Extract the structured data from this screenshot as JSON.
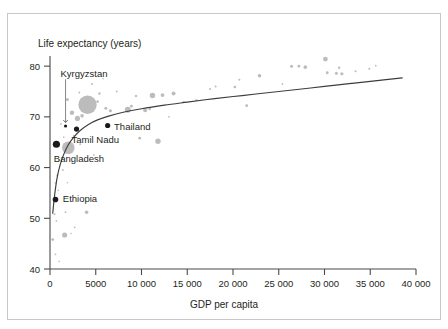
{
  "figure": {
    "background_color": "#ffffff",
    "frame_color": "#c9c9c9",
    "axis_color": "#4a4a4a",
    "trend_color": "#3d3d3d",
    "bubble_color": "#b3b3b3",
    "highlight_color": "#1a1a1a"
  },
  "chart_data": {
    "type": "scatter",
    "title": "",
    "subtitle": "",
    "xlabel": "GDP per capita",
    "ylabel": "Life expectancy (years)",
    "xlim": [
      0,
      40000
    ],
    "ylim": [
      40,
      82
    ],
    "grid": false,
    "legend": "none",
    "xticks": [
      0,
      5000,
      10000,
      15000,
      20000,
      25000,
      30000,
      35000,
      40000
    ],
    "xtick_labels": [
      "0",
      "5000",
      "10 000",
      "15 000",
      "20 000",
      "25 000",
      "30 000",
      "35 000",
      "40 000"
    ],
    "yticks": [
      40,
      50,
      60,
      70,
      80
    ],
    "ytick_labels": [
      "40",
      "50",
      "60",
      "70",
      "80"
    ],
    "annotations": [
      {
        "label": "Kyrgyzstan",
        "x": 1700,
        "y": 68.2,
        "text_x": 1150,
        "text_y": 78.6,
        "arrow": true
      },
      {
        "label": "Thailand",
        "x": 6300,
        "y": 68.3,
        "text_x": 7000,
        "text_y": 68.0,
        "arrow": false
      },
      {
        "label": "Tamil Nadu",
        "x": 2900,
        "y": 67.6,
        "text_x": 2350,
        "text_y": 65.6,
        "arrow": false
      },
      {
        "label": "Bangladesh",
        "x": 700,
        "y": 64.6,
        "text_x": 420,
        "text_y": 61.7,
        "arrow": false
      },
      {
        "label": "Ethiopia",
        "x": 600,
        "y": 53.7,
        "text_x": 1400,
        "text_y": 53.9,
        "arrow": false
      }
    ],
    "highlight_points": [
      {
        "name": "Kyrgyzstan",
        "x": 1700,
        "y": 68.2,
        "r": 1.6
      },
      {
        "name": "Tamil Nadu",
        "x": 2900,
        "y": 67.6,
        "r": 2.6
      },
      {
        "name": "Thailand",
        "x": 6300,
        "y": 68.3,
        "r": 2.6
      },
      {
        "name": "Bangladesh",
        "x": 700,
        "y": 64.6,
        "r": 3.6
      },
      {
        "name": "Ethiopia",
        "x": 600,
        "y": 53.7,
        "r": 2.8
      }
    ],
    "bubbles": [
      {
        "x": 4100,
        "y": 72.4,
        "r": 9.2
      },
      {
        "x": 2000,
        "y": 63.9,
        "r": 6.3
      },
      {
        "x": 3000,
        "y": 69.7,
        "r": 2.6
      },
      {
        "x": 2400,
        "y": 70.8,
        "r": 2.2
      },
      {
        "x": 3500,
        "y": 70.2,
        "r": 1.8
      },
      {
        "x": 1900,
        "y": 73.4,
        "r": 1.5
      },
      {
        "x": 5200,
        "y": 73.0,
        "r": 1.3
      },
      {
        "x": 5400,
        "y": 74.6,
        "r": 1.2
      },
      {
        "x": 6100,
        "y": 71.7,
        "r": 1.5
      },
      {
        "x": 6600,
        "y": 71.2,
        "r": 1.6
      },
      {
        "x": 8500,
        "y": 71.4,
        "r": 3.0
      },
      {
        "x": 8900,
        "y": 72.1,
        "r": 1.4
      },
      {
        "x": 9400,
        "y": 74.1,
        "r": 1.2
      },
      {
        "x": 10400,
        "y": 71.3,
        "r": 2.0
      },
      {
        "x": 10900,
        "y": 71.6,
        "r": 1.4
      },
      {
        "x": 11200,
        "y": 74.2,
        "r": 2.7
      },
      {
        "x": 12300,
        "y": 74.3,
        "r": 1.9
      },
      {
        "x": 11800,
        "y": 65.2,
        "r": 2.7
      },
      {
        "x": 13500,
        "y": 74.6,
        "r": 2.0
      },
      {
        "x": 14600,
        "y": 72.9,
        "r": 1.1
      },
      {
        "x": 16000,
        "y": 73.3,
        "r": 1.0
      },
      {
        "x": 17500,
        "y": 75.5,
        "r": 1.0
      },
      {
        "x": 18100,
        "y": 76.0,
        "r": 1.0
      },
      {
        "x": 20200,
        "y": 75.9,
        "r": 1.3
      },
      {
        "x": 20700,
        "y": 77.3,
        "r": 1.0
      },
      {
        "x": 21500,
        "y": 72.2,
        "r": 1.4
      },
      {
        "x": 22900,
        "y": 78.1,
        "r": 1.8
      },
      {
        "x": 25400,
        "y": 76.5,
        "r": 0.9
      },
      {
        "x": 26400,
        "y": 80.0,
        "r": 1.5
      },
      {
        "x": 27200,
        "y": 80.0,
        "r": 1.4
      },
      {
        "x": 27900,
        "y": 79.8,
        "r": 1.8
      },
      {
        "x": 30100,
        "y": 81.4,
        "r": 2.4
      },
      {
        "x": 30300,
        "y": 78.7,
        "r": 1.4
      },
      {
        "x": 31300,
        "y": 78.6,
        "r": 1.5
      },
      {
        "x": 31600,
        "y": 79.7,
        "r": 1.2
      },
      {
        "x": 31900,
        "y": 78.5,
        "r": 1.6
      },
      {
        "x": 33400,
        "y": 79.0,
        "r": 1.0
      },
      {
        "x": 34900,
        "y": 79.5,
        "r": 1.0
      },
      {
        "x": 35600,
        "y": 80.1,
        "r": 0.9
      },
      {
        "x": 4600,
        "y": 76.5,
        "r": 1.0
      },
      {
        "x": 5800,
        "y": 77.5,
        "r": 0.8
      },
      {
        "x": 7300,
        "y": 75.0,
        "r": 0.9
      },
      {
        "x": 3200,
        "y": 74.8,
        "r": 0.9
      },
      {
        "x": 2600,
        "y": 66.3,
        "r": 0.9
      },
      {
        "x": 1200,
        "y": 68.6,
        "r": 0.9
      },
      {
        "x": 1500,
        "y": 66.0,
        "r": 0.8
      },
      {
        "x": 1000,
        "y": 61.5,
        "r": 0.9
      },
      {
        "x": 1400,
        "y": 59.5,
        "r": 1.0
      },
      {
        "x": 800,
        "y": 58.5,
        "r": 0.9
      },
      {
        "x": 600,
        "y": 57.0,
        "r": 0.9
      },
      {
        "x": 900,
        "y": 55.5,
        "r": 0.8
      },
      {
        "x": 1700,
        "y": 51.2,
        "r": 0.9
      },
      {
        "x": 500,
        "y": 50.8,
        "r": 1.0
      },
      {
        "x": 700,
        "y": 49.5,
        "r": 0.9
      },
      {
        "x": 1600,
        "y": 46.7,
        "r": 2.6
      },
      {
        "x": 300,
        "y": 45.8,
        "r": 1.4
      },
      {
        "x": 2300,
        "y": 47.0,
        "r": 0.8
      },
      {
        "x": 600,
        "y": 42.9,
        "r": 0.9
      },
      {
        "x": 1000,
        "y": 41.5,
        "r": 0.8
      },
      {
        "x": 4000,
        "y": 51.2,
        "r": 1.8
      },
      {
        "x": 3300,
        "y": 64.6,
        "r": 0.9
      },
      {
        "x": 9800,
        "y": 65.8,
        "r": 1.4
      },
      {
        "x": 13000,
        "y": 70.0,
        "r": 0.9
      },
      {
        "x": 4800,
        "y": 62.5,
        "r": 0.9
      },
      {
        "x": 1900,
        "y": 57.0,
        "r": 0.8
      },
      {
        "x": 2700,
        "y": 48.2,
        "r": 0.8
      }
    ],
    "trend_line": {
      "description": "Fitted logarithmic curve of life expectancy against GDP per capita",
      "points": [
        [
          300,
          51.0
        ],
        [
          500,
          54.5
        ],
        [
          800,
          58.2
        ],
        [
          1100,
          60.5
        ],
        [
          1500,
          62.6
        ],
        [
          2000,
          64.5
        ],
        [
          2600,
          66.0
        ],
        [
          3300,
          67.3
        ],
        [
          4200,
          68.5
        ],
        [
          5200,
          69.4
        ],
        [
          6500,
          70.2
        ],
        [
          8000,
          70.9
        ],
        [
          10000,
          71.6
        ],
        [
          12500,
          72.3
        ],
        [
          15000,
          72.9
        ],
        [
          18000,
          73.6
        ],
        [
          21000,
          74.2
        ],
        [
          24000,
          74.8
        ],
        [
          27000,
          75.4
        ],
        [
          30000,
          76.0
        ],
        [
          33000,
          76.6
        ],
        [
          36000,
          77.2
        ],
        [
          38500,
          77.7
        ]
      ]
    }
  }
}
